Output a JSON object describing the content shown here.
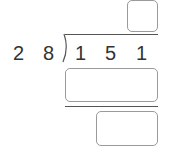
{
  "problem": {
    "divisor": [
      "2",
      "8"
    ],
    "dividend": [
      "1",
      "5",
      "1"
    ]
  },
  "answer_boxes": {
    "quotient": "",
    "product": "",
    "remainder": ""
  }
}
